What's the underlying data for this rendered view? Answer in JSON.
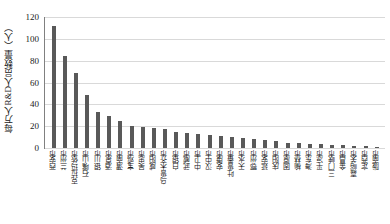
{
  "chart_data": {
    "type": "bar",
    "title": "",
    "xlabel": "",
    "ylabel": "每万人R&D人员数量（人）",
    "ylim": [
      0,
      120
    ],
    "yticks": [
      120,
      100,
      80,
      60,
      40,
      20,
      0
    ],
    "grid": true,
    "legend": "none",
    "bar_color": "#595959",
    "categories": [
      "西安市",
      "兰州市",
      "克拉玛依市",
      "石嘴山市",
      "银川市",
      "酒泉市",
      "渭南市",
      "宝鸡市",
      "吴忠市",
      "咸阳市",
      "乌鲁木齐市",
      "白银市",
      "武威市",
      "中卫市",
      "汉中市",
      "安康市",
      "吐鲁番市",
      "天水市",
      "鄂州市",
      "延安市",
      "庆阳市",
      "固原市",
      "榆林市",
      "海东市",
      "平凉市",
      "三门峡市",
      "金昌市",
      "嘉峪关市",
      "定西市",
      "陇南市"
    ],
    "values": [
      112,
      84,
      69,
      49,
      33,
      29,
      25,
      20,
      19,
      18,
      17,
      15,
      14,
      13,
      12,
      11,
      10,
      9,
      8,
      7,
      6,
      5,
      5,
      4,
      4,
      3,
      3,
      2,
      2,
      1
    ]
  }
}
